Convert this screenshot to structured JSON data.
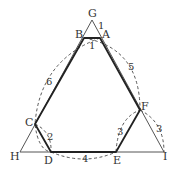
{
  "diagram": {
    "type": "geometry",
    "points": {
      "G": {
        "label": "G",
        "x": 92,
        "y": 20
      },
      "A": {
        "label": "A",
        "x": 100,
        "y": 38
      },
      "B": {
        "label": "B",
        "x": 84,
        "y": 38
      },
      "C": {
        "label": "C",
        "x": 35,
        "y": 124
      },
      "D": {
        "label": "D",
        "x": 51,
        "y": 152
      },
      "E": {
        "label": "E",
        "x": 116,
        "y": 152
      },
      "F": {
        "label": "F",
        "x": 140,
        "y": 110
      },
      "H": {
        "label": "H",
        "x": 20,
        "y": 152
      },
      "I": {
        "label": "I",
        "x": 164,
        "y": 152
      }
    },
    "segment_labels": {
      "GA": "1",
      "AB": "1",
      "AF": "5",
      "BC": "6",
      "CD": "2",
      "DE": "4",
      "EF": "3",
      "FI": "3"
    },
    "colors": {
      "thick_line": "#222222",
      "thin_line": "#555555",
      "dashed_arc": "#444444",
      "text": "#333333"
    }
  }
}
